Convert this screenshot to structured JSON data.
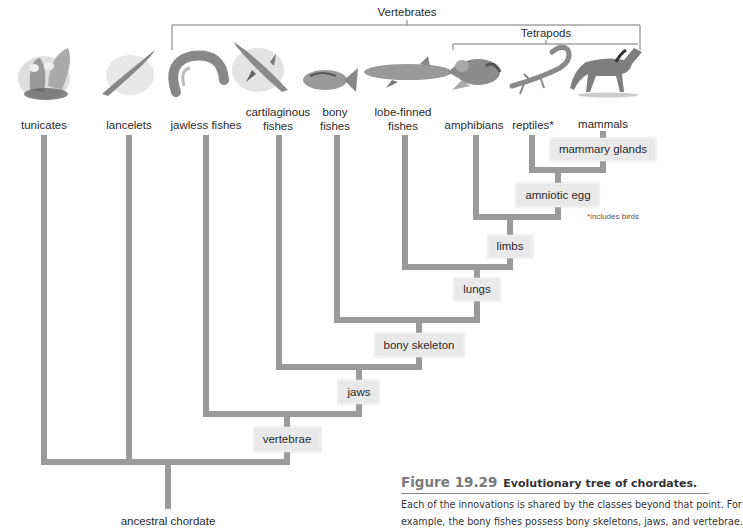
{
  "figure": {
    "number": "Figure 19.29",
    "title": "Evolutionary tree of chordates.",
    "caption_lines": [
      "Each of the  innovations is shared by the classes beyond that point. For",
      "example, the bony fishes possess bony skeletons, jaws, and vertebrae."
    ]
  },
  "clades": {
    "vertebrates": "Vertebrates",
    "tetrapods": "Tetrapods"
  },
  "taxa": [
    {
      "id": "tunicates",
      "label": "tunicates",
      "icon": "tunicate-icon"
    },
    {
      "id": "lancelets",
      "label": "lancelets",
      "icon": "lancelet-icon"
    },
    {
      "id": "jawless-fishes",
      "label": "jawless fishes",
      "icon": "lamprey-icon"
    },
    {
      "id": "cartilaginous-fishes",
      "label_line1": "cartilaginous",
      "label_line2": "fishes",
      "icon": "shark-icon"
    },
    {
      "id": "bony-fishes",
      "label_line1": "bony",
      "label_line2": "fishes",
      "icon": "bony-fish-icon"
    },
    {
      "id": "lobe-finned-fishes",
      "label_line1": "lobe-finned",
      "label_line2": "fishes",
      "icon": "lobe-finned-fish-icon"
    },
    {
      "id": "amphibians",
      "label": "amphibians",
      "icon": "frog-icon"
    },
    {
      "id": "reptiles",
      "label": "reptiles*",
      "icon": "lizard-icon"
    },
    {
      "id": "mammals",
      "label": "mammals",
      "icon": "horse-icon"
    }
  ],
  "innovations": [
    {
      "id": "vertebrae",
      "label": "vertebrae"
    },
    {
      "id": "jaws",
      "label": "jaws"
    },
    {
      "id": "bony-skeleton",
      "label": "bony skeleton"
    },
    {
      "id": "lungs",
      "label": "lungs"
    },
    {
      "id": "limbs",
      "label": "limbs"
    },
    {
      "id": "amniotic-egg",
      "label": "amniotic egg"
    },
    {
      "id": "mammary-glands",
      "label": "mammary glands"
    }
  ],
  "root": {
    "label": "ancestral chordate"
  },
  "footnote": "*includes birds",
  "colors": {
    "branch": "#9a9a9a",
    "node_bg": "#e9e9e9",
    "bracket": "#777777",
    "figure_number": "#7a7a7a"
  }
}
